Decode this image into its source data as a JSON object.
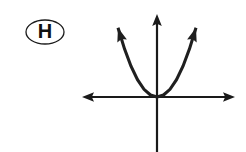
{
  "figure": {
    "label": {
      "text": "H",
      "shape": "ellipse",
      "font_size": 20,
      "center_x": 45,
      "center_y": 32,
      "rx": 19,
      "ry": 12,
      "stroke_width": 1.3
    },
    "colors": {
      "ink": "#1a1a1a",
      "background": "#ffffff",
      "curve": "#1f1f1f"
    },
    "canvas": {
      "width": 246,
      "height": 152
    },
    "axes": {
      "origin_x": 157,
      "origin_y": 97,
      "x_axis": {
        "left_end": 82,
        "right_end": 235,
        "stroke_width": 2.2,
        "arrow_left": true,
        "arrow_right": true
      },
      "y_axis": {
        "top_end": 14,
        "bottom_end": 152,
        "stroke_width": 2.2,
        "arrow_up": true,
        "arrow_down": false
      }
    }
  },
  "chart_data": {
    "type": "line",
    "title": "H",
    "xlabel": "",
    "ylabel": "",
    "grid": false,
    "legend": null,
    "annotations": [
      "H"
    ],
    "function": "y = a*x^2, a > 0, vertex (0, 0)",
    "vertex": [
      0,
      0
    ],
    "opens": "up",
    "symmetry_axis": "x = 0",
    "x": [
      -39,
      -32.5,
      -26,
      -19.5,
      -13,
      -6.5,
      0,
      6.5,
      13,
      19.5,
      26,
      32.5,
      39
    ],
    "y": [
      81,
      56.3,
      36,
      20.3,
      9,
      2.3,
      0,
      2.3,
      9,
      20.3,
      36,
      56.3,
      81
    ],
    "series": [
      {
        "name": "parabola",
        "values": [
          81,
          56.3,
          36,
          20.3,
          9,
          2.3,
          0,
          2.3,
          9,
          20.3,
          36,
          56.3,
          81
        ]
      }
    ],
    "xlim": [
      -75,
      78
    ],
    "ylim": [
      -55,
      83
    ],
    "tick_labels_x": [],
    "tick_labels_y": []
  }
}
